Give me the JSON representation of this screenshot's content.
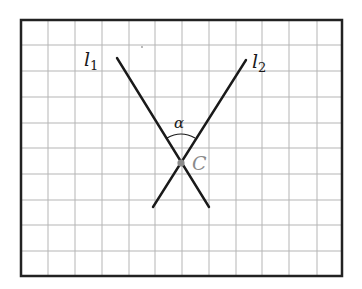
{
  "figure": {
    "frame": {
      "x1": 21,
      "y1": 20,
      "x2": 342,
      "y2": 276
    },
    "grid": {
      "vertical": [
        48,
        75,
        102,
        129,
        155,
        182,
        209,
        236,
        262,
        289,
        317
      ],
      "horizontal": [
        45,
        71,
        97,
        123,
        148,
        174,
        200,
        225,
        251
      ]
    },
    "lines": [
      {
        "id": "l1",
        "label": "l",
        "subscript": "1",
        "x1": 117,
        "y1": 58,
        "x2": 209,
        "y2": 207
      },
      {
        "id": "l2",
        "label": "l",
        "subscript": "2",
        "x1": 246,
        "y1": 60,
        "x2": 153,
        "y2": 207
      }
    ],
    "point": {
      "label": "C",
      "x": 181,
      "y": 163
    },
    "angle": {
      "label": "α"
    },
    "colors": {
      "frame": "#222222",
      "grid": "#b5b5b5",
      "line": "#1a1a1a",
      "point": "#8a8a8a",
      "point_label": "#8a8a8a",
      "text": "#1a1a1a"
    }
  }
}
